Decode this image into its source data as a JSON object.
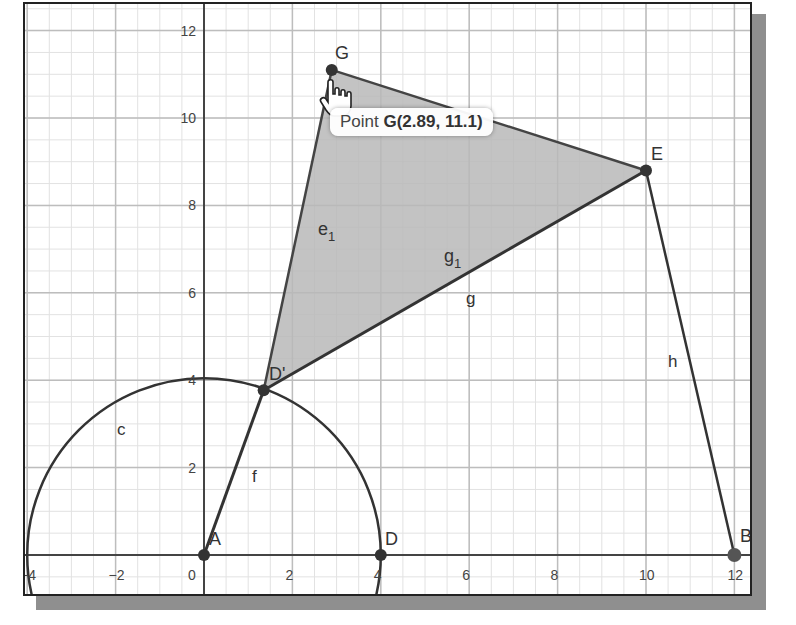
{
  "app": {
    "type": "geometry-graphing-view"
  },
  "axes": {
    "x_ticks": [
      "-4",
      "-2",
      "0",
      "2",
      "4",
      "6",
      "8",
      "10",
      "12"
    ],
    "y_ticks": [
      "2",
      "4",
      "6",
      "8",
      "10",
      "12"
    ],
    "origin_label": "0"
  },
  "points": [
    {
      "name": "A",
      "label": "A",
      "x": 0,
      "y": 0
    },
    {
      "name": "B",
      "label": "B",
      "x": 12,
      "y": 0
    },
    {
      "name": "D",
      "label": "D",
      "x": 4,
      "y": 0
    },
    {
      "name": "D'",
      "label": "D'",
      "x": 1.35,
      "y": 3.77
    },
    {
      "name": "E",
      "label": "E",
      "x": 10,
      "y": 8.8
    },
    {
      "name": "G",
      "label": "G",
      "x": 2.89,
      "y": 11.1
    }
  ],
  "objects": {
    "circle_label": "c",
    "segment_f": "f",
    "segment_g": "g",
    "segment_h": "h",
    "polygon_side_e1_base": "e",
    "polygon_side_e1_sub": "1",
    "polygon_side_g1_base": "g",
    "polygon_side_g1_sub": "1"
  },
  "tooltip": {
    "prefix": "Point ",
    "value": "G(2.89, 11.1)"
  },
  "colors": {
    "polygon_fill": "#b8b8b8",
    "stroke": "#3a3a3a",
    "grid_major": "#bdbdbd",
    "grid_minor": "#e2e2e2",
    "shadow": "#8f8f8f"
  }
}
